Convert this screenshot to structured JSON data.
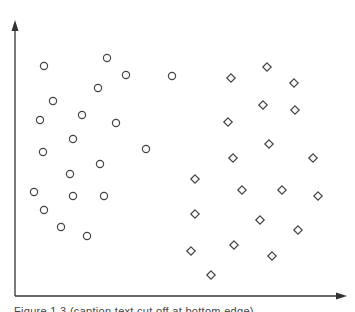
{
  "chart_data": {
    "type": "scatter",
    "title": "",
    "xlabel": "",
    "ylabel": "",
    "grid": false,
    "legend": null,
    "axes": {
      "style": "arrow-axes-no-ticks",
      "origin_px": [
        15,
        296
      ],
      "x_axis_end_px": [
        345,
        296
      ],
      "y_axis_end_px": [
        15,
        22
      ]
    },
    "series": [
      {
        "name": "class-circle",
        "marker": "circle",
        "points_px": [
          [
            44,
            66
          ],
          [
            107,
            58
          ],
          [
            126,
            75
          ],
          [
            172,
            76
          ],
          [
            98,
            88
          ],
          [
            53,
            101
          ],
          [
            40,
            120
          ],
          [
            82,
            115
          ],
          [
            116,
            123
          ],
          [
            73,
            139
          ],
          [
            43,
            152
          ],
          [
            146,
            149
          ],
          [
            100,
            164
          ],
          [
            70,
            174
          ],
          [
            34,
            192
          ],
          [
            73,
            196
          ],
          [
            104,
            196
          ],
          [
            44,
            210
          ],
          [
            61,
            227
          ],
          [
            87,
            236
          ]
        ]
      },
      {
        "name": "class-diamond",
        "marker": "diamond",
        "points_px": [
          [
            267,
            67
          ],
          [
            231,
            78
          ],
          [
            294,
            83
          ],
          [
            263,
            105
          ],
          [
            295,
            110
          ],
          [
            228,
            122
          ],
          [
            269,
            144
          ],
          [
            233,
            158
          ],
          [
            313,
            158
          ],
          [
            195,
            179
          ],
          [
            242,
            190
          ],
          [
            282,
            190
          ],
          [
            318,
            196
          ],
          [
            195,
            214
          ],
          [
            260,
            220
          ],
          [
            298,
            230
          ],
          [
            191,
            251
          ],
          [
            234,
            245
          ],
          [
            272,
            256
          ],
          [
            211,
            275
          ]
        ]
      }
    ]
  },
  "style": {
    "axis_color": "#333333",
    "marker_stroke": "#444444",
    "background": "#ffffff"
  },
  "caption": {
    "text": "Figure 1.3  (caption text cut off at bottom edge)"
  }
}
